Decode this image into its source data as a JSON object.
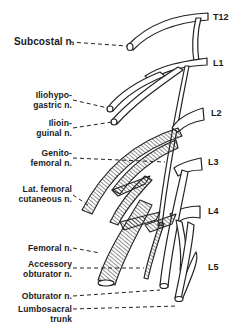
{
  "diagram": {
    "segments": [
      {
        "label": "T12",
        "x": 215,
        "y": 12
      },
      {
        "label": "L1",
        "x": 215,
        "y": 58
      },
      {
        "label": "L2",
        "x": 215,
        "y": 108
      },
      {
        "label": "L3",
        "x": 215,
        "y": 157
      },
      {
        "label": "L4",
        "x": 215,
        "y": 206
      },
      {
        "label": "L5",
        "x": 215,
        "y": 262
      }
    ],
    "nerve_labels": [
      {
        "line1": "Subcostal n.",
        "line2": "",
        "right": 200,
        "y": 36
      },
      {
        "line1": "Iliohypo-",
        "line2": "gastric n.",
        "right": 165,
        "y": 95
      },
      {
        "line1": "Ilioin-",
        "line2": "guinal n.",
        "right": 165,
        "y": 123
      },
      {
        "line1": "Genito-",
        "line2": "femoral n.",
        "right": 165,
        "y": 150
      },
      {
        "line1": "Lat. femoral",
        "line2": "cutaneous n.",
        "right": 165,
        "y": 186
      },
      {
        "line1": "Femoral n.",
        "line2": "",
        "right": 165,
        "y": 243
      },
      {
        "line1": "Accessory",
        "line2": "obturator n.",
        "right": 163,
        "y": 260
      },
      {
        "line1": "Obturator n.",
        "line2": "",
        "right": 165,
        "y": 291
      },
      {
        "line1": "Lumbosacral",
        "line2": "trunk",
        "right": 165,
        "y": 304
      }
    ]
  }
}
